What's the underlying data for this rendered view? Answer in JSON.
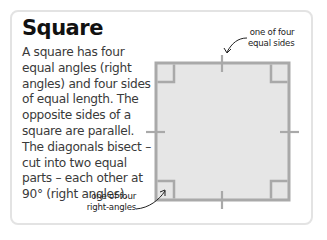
{
  "title": "Square",
  "description": "A square has four equal angles (right angles) and four sides of equal length. The opposite sides of a square are parallel. The diagonals bisect – cut into two equal parts – each other at 90° (right angles).",
  "labels": {
    "sides": [
      "one of four",
      "equal sides"
    ],
    "angles": [
      "one of four",
      "right-angles"
    ]
  },
  "colors": {
    "square_fill": "#e6e6e6",
    "square_stroke": "#a9a9a9",
    "card_border": "#e3e3e3",
    "arrow": "#222222"
  }
}
